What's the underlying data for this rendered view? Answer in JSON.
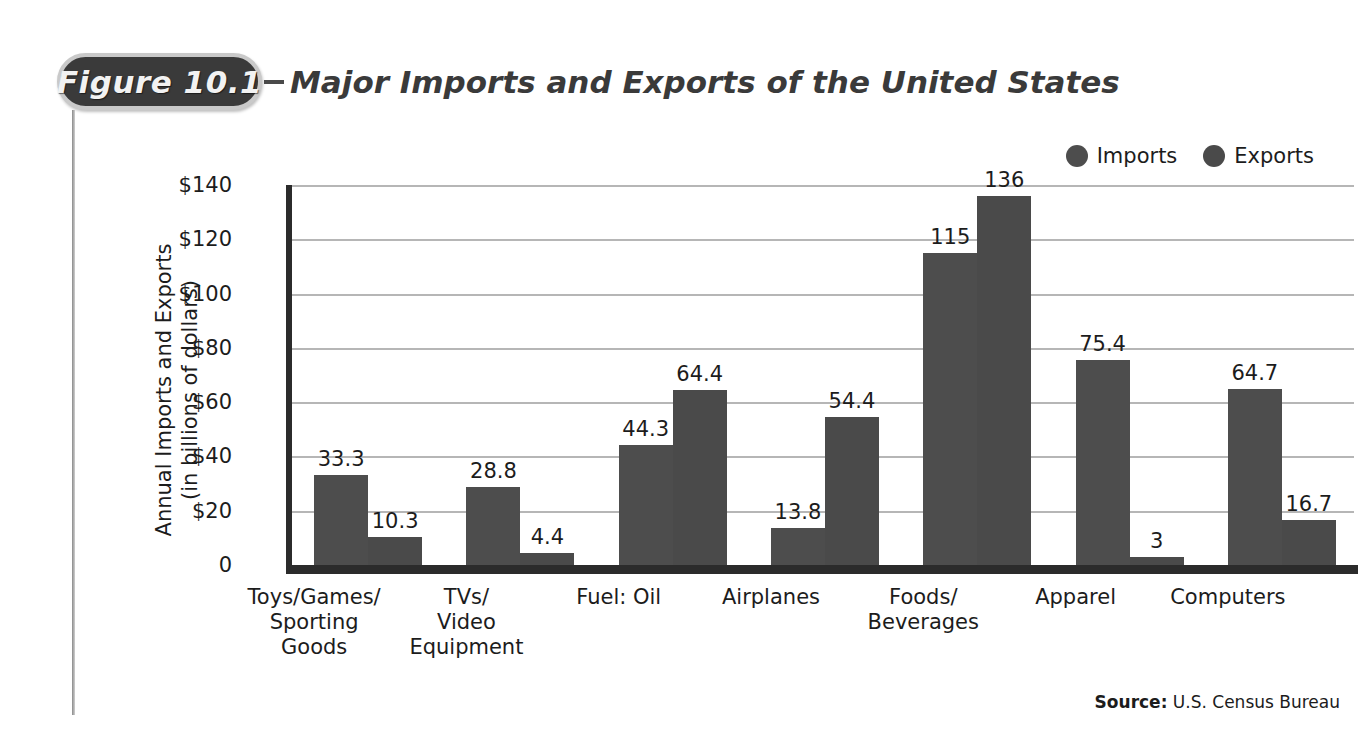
{
  "figure": {
    "badge_label": "Figure 10.1",
    "dash": "–",
    "title": "Major Imports and Exports of the United States"
  },
  "source": {
    "label": "Source:",
    "text": "U.S. Census Bureau"
  },
  "colors": {
    "imports_bar": "#4d4d4d",
    "exports_bar": "#4a4a4a",
    "axis": "#2b2b2b",
    "gridline": "#b6b6b6",
    "badge_bg": "#3a3a3a",
    "badge_border": "#c9c9c9",
    "text": "#1c1c1c"
  },
  "chart_data": {
    "type": "bar",
    "title": "Major Imports and Exports of the United States",
    "xlabel": "",
    "ylabel": "Annual Imports and Exports (in billions of dollars)",
    "ylabel_line1": "Annual Imports and Exports",
    "ylabel_line2": "(in billions of dollars)",
    "ylim": [
      0,
      140
    ],
    "yticks": [
      0,
      20,
      40,
      60,
      80,
      100,
      120,
      140
    ],
    "ytick_labels": [
      "0",
      "$20",
      "$40",
      "$60",
      "$80",
      "$100",
      "$120",
      "$140"
    ],
    "grid": true,
    "legend_position": "top-right",
    "categories": [
      "Toys/Games/\nSporting\nGoods",
      "TVs/\nVideo\nEquipment",
      "Fuel: Oil",
      "Airplanes",
      "Foods/\nBeverages",
      "Apparel",
      "Computers"
    ],
    "category_lines": [
      [
        "Toys/Games/",
        "Sporting",
        "Goods"
      ],
      [
        "TVs/",
        "Video",
        "Equipment"
      ],
      [
        "Fuel: Oil"
      ],
      [
        "Airplanes"
      ],
      [
        "Foods/",
        "Beverages"
      ],
      [
        "Apparel"
      ],
      [
        "Computers"
      ]
    ],
    "series": [
      {
        "name": "Imports",
        "values": [
          33.3,
          28.8,
          44.3,
          13.8,
          115,
          75.4,
          64.7
        ],
        "labels": [
          "33.3",
          "28.8",
          "44.3",
          "13.8",
          "115",
          "75.4",
          "64.7"
        ]
      },
      {
        "name": "Exports",
        "values": [
          10.3,
          4.4,
          64.4,
          54.4,
          136,
          3,
          16.7
        ],
        "labels": [
          "10.3",
          "4.4",
          "64.4",
          "54.4",
          "136",
          "3",
          "16.7"
        ]
      }
    ]
  }
}
